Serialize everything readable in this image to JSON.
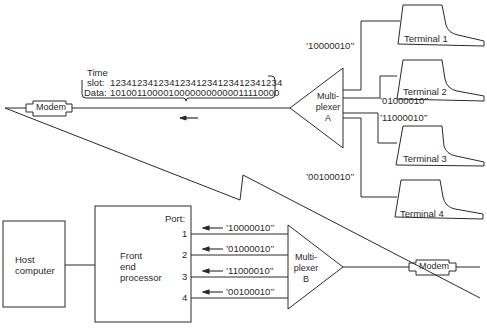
{
  "time_slot_box": {
    "time_label": "Time",
    "slot_label": "slot:",
    "slot_value": "12341234123412341234123412341234",
    "data_label": "Data:",
    "data_value": "10100110000100000000000011110000"
  },
  "remote_side": {
    "modem_label": "Modem",
    "multiplexer": {
      "line1": "Multi-",
      "line2": "plexer",
      "line3": "A"
    },
    "terminals": [
      {
        "label": "Terminal 1",
        "code": "’10000010’’"
      },
      {
        "label": "Terminal 2",
        "code": "’01000010’’"
      },
      {
        "label": "Terminal 3",
        "code": "’11000010’’"
      },
      {
        "label": "Terminal 4",
        "code": "’00100010’’"
      }
    ]
  },
  "host_side": {
    "host": {
      "line1": "Host",
      "line2": "computer"
    },
    "fep": {
      "line1": "Front",
      "line2": "end",
      "line3": "processor"
    },
    "port_label": "Port:",
    "ports": [
      {
        "number": "1",
        "code": "’10000010’’"
      },
      {
        "number": "2",
        "code": "’01000010’’"
      },
      {
        "number": "3",
        "code": "’11000010’’"
      },
      {
        "number": "4",
        "code": "’00100010’’"
      }
    ],
    "multiplexer": {
      "line1": "Multi-",
      "line2": "plexer",
      "line3": "B"
    },
    "modem_label": "Modem"
  }
}
